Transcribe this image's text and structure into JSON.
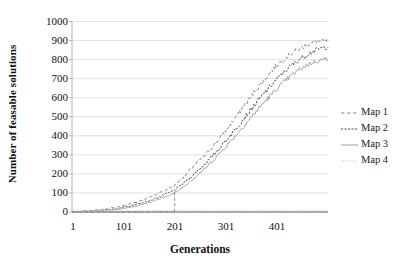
{
  "chart_data": {
    "type": "line",
    "title": "",
    "xlabel": "Generations",
    "ylabel": "Number of feasable solutions",
    "xlim": [
      1,
      500
    ],
    "ylim": [
      0,
      1000
    ],
    "grid": true,
    "legend_position": "right",
    "y_ticks": [
      1000,
      900,
      800,
      700,
      600,
      500,
      400,
      300,
      200,
      100,
      0
    ],
    "x_ticks": [
      1,
      101,
      201,
      301,
      401
    ],
    "x": [
      1,
      21,
      41,
      61,
      81,
      101,
      121,
      141,
      161,
      181,
      201,
      221,
      241,
      261,
      281,
      301,
      321,
      341,
      361,
      381,
      401,
      421,
      441,
      461,
      481,
      500
    ],
    "series": [
      {
        "name": "Map 1",
        "style": "dashed",
        "color": "#8a8a8a",
        "values": [
          0,
          3,
          8,
          14,
          22,
          33,
          48,
          66,
          88,
          112,
          140,
          190,
          248,
          300,
          360,
          430,
          500,
          575,
          645,
          712,
          772,
          818,
          852,
          880,
          895,
          900
        ]
      },
      {
        "name": "Map 2",
        "style": "dash-dot",
        "color": "#555555",
        "values": [
          0,
          2,
          5,
          9,
          15,
          24,
          36,
          50,
          68,
          90,
          115,
          155,
          205,
          255,
          312,
          375,
          440,
          508,
          575,
          640,
          700,
          752,
          795,
          830,
          855,
          868
        ]
      },
      {
        "name": "Map 3",
        "style": "solid",
        "color": "#a8a8a8",
        "values": [
          0,
          2,
          4,
          7,
          12,
          19,
          29,
          42,
          58,
          78,
          100,
          138,
          182,
          230,
          285,
          345,
          405,
          468,
          532,
          592,
          648,
          700,
          742,
          775,
          795,
          805
        ]
      },
      {
        "name": "Map 4",
        "style": "dotted",
        "color": "#b5b5b5",
        "values": [
          0,
          0,
          0,
          0,
          0,
          0,
          0,
          0,
          0,
          0,
          0,
          0,
          0,
          0,
          0,
          0,
          0,
          0,
          0,
          0,
          0,
          0,
          0,
          0,
          0,
          0
        ]
      }
    ],
    "annotations": [
      {
        "type": "vertical-jump",
        "series": "Map 1",
        "x": 201,
        "from": 0,
        "to": 115,
        "note": "Map 1 trace drops to the baseline and rejoins with a vertical dashed segment near generation 201"
      }
    ]
  },
  "legend": {
    "entries": [
      {
        "label": "Map 1",
        "key": "dashed-line-key"
      },
      {
        "label": "Map 2",
        "key": "dash-dot-line-key"
      },
      {
        "label": "Map 3",
        "key": "solid-line-key"
      },
      {
        "label": "Map 4",
        "key": "dotted-line-key"
      }
    ]
  },
  "axes": {
    "y_title": "Number of feasable solutions",
    "x_title": "Generations"
  }
}
